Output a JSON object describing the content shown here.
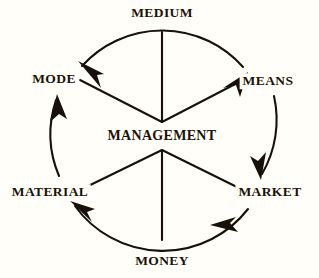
{
  "diagram": {
    "center": {
      "label": "MANAGEMENT",
      "x": 162,
      "y": 136
    },
    "colors": {
      "background": "#fffef8",
      "ink": "#1a1208",
      "stroke": "#17110a"
    },
    "geometry": {
      "cx": 162,
      "cy": 136,
      "radius": 108,
      "hub_x": 162,
      "hub_y": 122,
      "hub_bottom_y": 150
    },
    "nodes": [
      {
        "id": "medium",
        "label": "MEDIUM",
        "x": 162,
        "y": 13,
        "angle_deg": 90
      },
      {
        "id": "means",
        "label": "MEANS",
        "x": 268,
        "y": 81,
        "angle_deg": 30
      },
      {
        "id": "market",
        "label": "MARKET",
        "x": 270,
        "y": 192,
        "angle_deg": 330
      },
      {
        "id": "money",
        "label": "MONEY",
        "x": 162,
        "y": 261,
        "angle_deg": 270
      },
      {
        "id": "material",
        "label": "MATERIAL",
        "x": 50,
        "y": 192,
        "angle_deg": 210
      },
      {
        "id": "mode",
        "label": "MODE",
        "x": 54,
        "y": 79,
        "angle_deg": 150
      }
    ],
    "arcs": [
      {
        "id": "arc-top",
        "from": "mode",
        "to": "means",
        "arrowheads": "both",
        "direction": "bidirectional"
      },
      {
        "id": "arc-right",
        "from": "means",
        "to": "market",
        "arrowheads": "end",
        "direction": "clockwise"
      },
      {
        "id": "arc-bottom",
        "from": "market",
        "to": "material",
        "arrowheads": "both",
        "direction": "counterclockwise"
      },
      {
        "id": "arc-left",
        "from": "material",
        "to": "mode",
        "arrowheads": "end",
        "direction": "clockwise"
      }
    ],
    "spokes": [
      {
        "id": "spoke-medium",
        "to": "medium"
      },
      {
        "id": "spoke-means",
        "to": "means"
      },
      {
        "id": "spoke-market",
        "to": "market"
      },
      {
        "id": "spoke-money",
        "to": "money"
      },
      {
        "id": "spoke-material",
        "to": "material"
      },
      {
        "id": "spoke-mode",
        "to": "mode"
      }
    ]
  }
}
